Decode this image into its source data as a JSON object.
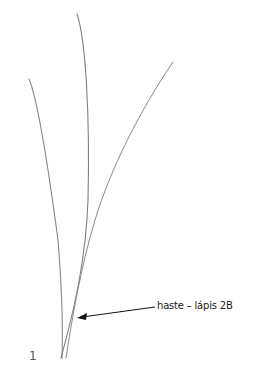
{
  "figure": {
    "number": "1",
    "annotation": "haste – lápis 2B"
  },
  "colors": {
    "background": "#ffffff",
    "stroke": "#7a7a7a",
    "arrow": "#111111",
    "text": "#1a1a1a"
  }
}
